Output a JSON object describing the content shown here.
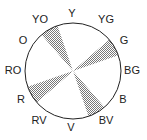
{
  "labels": {
    "Y": "Y",
    "YG": "YG",
    "G": "G",
    "BG": "BG",
    "B": "B",
    "BV": "BV",
    "V": "V",
    "RV": "RV",
    "R": "R",
    "RO": "RO",
    "O": "O",
    "YO": "YO"
  },
  "shaded_sectors": [
    "YO",
    "G",
    "BV",
    "R"
  ],
  "colors": {
    "line": "#222222",
    "shade": "#999999"
  }
}
